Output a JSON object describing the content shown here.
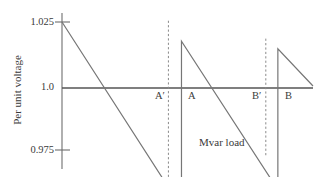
{
  "chart_data": {
    "type": "line",
    "title": "",
    "xlabel": "",
    "ylabel": "Per unit voltage",
    "ylim": [
      0.975,
      1.025
    ],
    "xlim": [
      0,
      100
    ],
    "grid": false,
    "legend": null,
    "y_ticks": [
      {
        "value": 1.025,
        "label": "1.025"
      },
      {
        "value": 1.0,
        "label": "1.0"
      },
      {
        "value": 0.975,
        "label": "0.975"
      }
    ],
    "x_ticks": [],
    "series": [
      {
        "name": "Per unit voltage sawtooth",
        "style": "solid",
        "points": [
          {
            "x": 0.0,
            "y": 1.025
          },
          {
            "x": 47.6,
            "y": 0.9525
          },
          {
            "x": 47.6,
            "y": 1.0175
          },
          {
            "x": 86.0,
            "y": 0.9595
          },
          {
            "x": 86.0,
            "y": 1.0145
          },
          {
            "x": 100.0,
            "y": 1.0
          }
        ]
      }
    ],
    "reference_lines": [
      {
        "name": "A-prime",
        "style": "dashed",
        "x": 42.4,
        "y_top": 1.0255,
        "y_bottom": 0.9515
      },
      {
        "name": "B-prime",
        "style": "dashed",
        "x": 81.2,
        "y_top": 1.0185,
        "y_bottom": 0.9725
      }
    ],
    "annotations": [
      {
        "name": "A-prime-label",
        "text": "A′",
        "x": 38.0,
        "y": 0.9965
      },
      {
        "name": "A-label",
        "text": "A",
        "x": 51.0,
        "y": 0.9965
      },
      {
        "name": "B-prime-label",
        "text": "B′",
        "x": 77.0,
        "y": 0.9965
      },
      {
        "name": "B-label",
        "text": "B",
        "x": 90.0,
        "y": 0.9965
      },
      {
        "name": "mvar-load-label",
        "text": "Mvar load",
        "x": 56.0,
        "y": 0.9795
      }
    ],
    "colors": {
      "axis": "#555555",
      "curve": "#6b6b6b",
      "dashed": "#808080",
      "text": "#3a3a3a",
      "background": "#ffffff"
    }
  },
  "axis": {
    "y_label": "Per unit voltage",
    "tick_1025": "1.025",
    "tick_100": "1.0",
    "tick_0975": "0.975"
  },
  "markers": {
    "a_prime": "A′",
    "a": "A",
    "b_prime": "B′",
    "b": "B"
  },
  "annotation": {
    "mvar_load": "Mvar load"
  }
}
